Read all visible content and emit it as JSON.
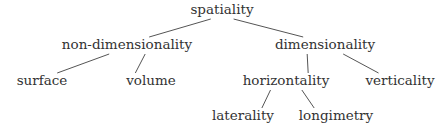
{
  "diagram": {
    "type": "tree",
    "text_color": "#333333",
    "edge_color": "#555555",
    "nodes": [
      {
        "id": "spatiality",
        "label": "spatiality",
        "parent": null
      },
      {
        "id": "non-dimensionality",
        "label": "non-dimensionality",
        "parent": "spatiality"
      },
      {
        "id": "dimensionality",
        "label": "dimensionality",
        "parent": "spatiality"
      },
      {
        "id": "surface",
        "label": "surface",
        "parent": "non-dimensionality"
      },
      {
        "id": "volume",
        "label": "volume",
        "parent": "non-dimensionality"
      },
      {
        "id": "horizontality",
        "label": "horizontality",
        "parent": "dimensionality"
      },
      {
        "id": "verticality",
        "label": "verticality",
        "parent": "dimensionality"
      },
      {
        "id": "laterality",
        "label": "laterality",
        "parent": "horizontality"
      },
      {
        "id": "longimetry",
        "label": "longimetry",
        "parent": "horizontality"
      }
    ]
  }
}
